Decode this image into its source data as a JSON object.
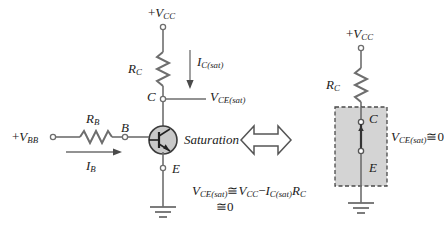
{
  "figure": {
    "background_color": "#ffffff",
    "line_color": "#6e6e6e",
    "text_color": "#1b1b1b",
    "shade_fill": "#d4d4d4",
    "transistor_fill": "#c9c9c9"
  },
  "left_circuit": {
    "supply_label": {
      "sign": "+",
      "symbol": "V",
      "sub": "CC"
    },
    "collector_resistor": {
      "symbol": "R",
      "sub": "C"
    },
    "collector_current": {
      "symbol": "I",
      "sub": "C(sat)"
    },
    "node_c": "C",
    "node_b": "B",
    "node_e": "E",
    "vce_label": {
      "symbol": "V",
      "sub": "CE(sat)"
    },
    "state_label": "Saturation",
    "base_supply_label": {
      "sign": "+",
      "symbol": "V",
      "sub": "BB"
    },
    "base_resistor": {
      "symbol": "R",
      "sub": "B"
    },
    "base_current": {
      "symbol": "I",
      "sub": "B"
    }
  },
  "equation": {
    "line1": {
      "lhs_symbol": "V",
      "lhs_sub": "CE(sat)",
      "approx": "≅",
      "t1_symbol": "V",
      "t1_sub": "CC",
      "minus": "−",
      "t2_symbol": "I",
      "t2_sub": "C(sat)",
      "t3_symbol": "R",
      "t3_sub": "C"
    },
    "line2": {
      "approx": "≅",
      "value": "0"
    }
  },
  "equivalence_arrow": {
    "name": "double-headed-arrow",
    "direction": "left-right"
  },
  "right_circuit": {
    "supply_label": {
      "sign": "+",
      "symbol": "V",
      "sub": "CC"
    },
    "collector_resistor": {
      "symbol": "R",
      "sub": "C"
    },
    "node_c": "C",
    "node_e": "E",
    "switch_state": "closed",
    "vce_label": {
      "symbol": "V",
      "sub": "CE(sat)",
      "approx": "≅",
      "value": "0"
    }
  }
}
